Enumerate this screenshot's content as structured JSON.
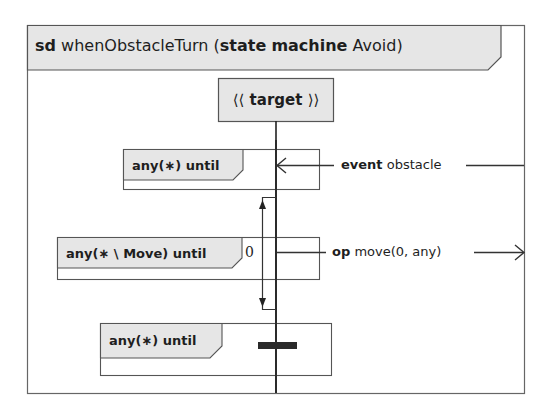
{
  "diagram": {
    "title": {
      "keyword": "sd",
      "name": "whenObstacleTurn",
      "open_paren": "(",
      "kw_state": "state",
      "kw_machine": "machine",
      "machine_name": "Avoid",
      "close_paren": ")"
    },
    "lifeline": {
      "left_guillemet": "⟨⟨",
      "stereotype": "target",
      "right_guillemet": "⟩⟩"
    },
    "fragments": [
      {
        "label": "any(∗) until"
      },
      {
        "label": "any(∗ \\ Move) until"
      },
      {
        "label": "any(∗) until"
      }
    ],
    "messages": [
      {
        "keyword": "event",
        "text": "obstacle",
        "direction": "incoming"
      },
      {
        "keyword": "op",
        "text": "move(0, any)",
        "direction": "outgoing"
      }
    ],
    "duration_constraint": {
      "value": "0"
    },
    "colors": {
      "fill": "#e6e6e6",
      "stroke": "#555555",
      "lifeline": "#222222",
      "bar": "#222222"
    }
  }
}
